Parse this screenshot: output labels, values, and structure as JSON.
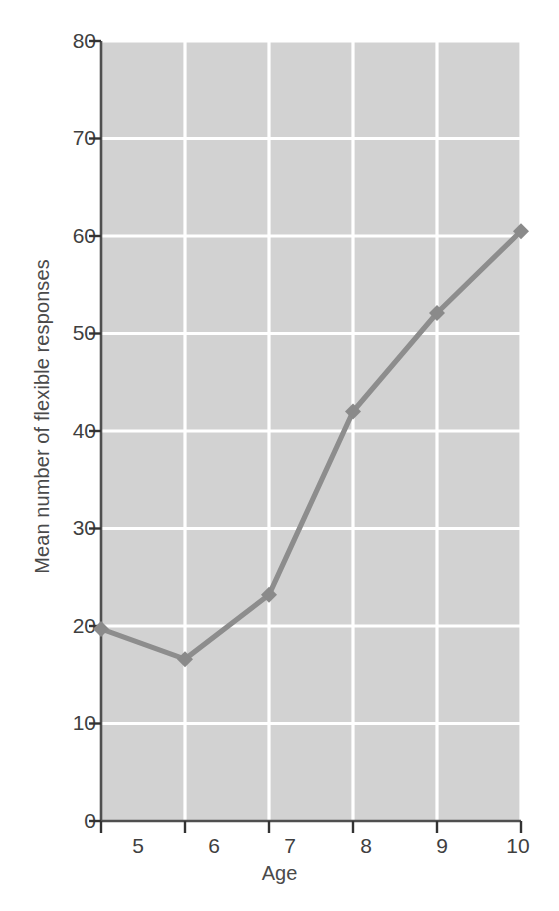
{
  "chart_data": {
    "type": "line",
    "title": "",
    "subtitle": "",
    "xlabel": "Age",
    "ylabel": "Mean number of flexible responses",
    "x": [
      5,
      6,
      7,
      8,
      9,
      10
    ],
    "categories": [
      "5",
      "6",
      "7",
      "8",
      "9",
      "10"
    ],
    "values": [
      19.7,
      16.6,
      23.2,
      42.0,
      52.1,
      60.5
    ],
    "series": [
      {
        "name": "Mean number of flexible responses",
        "values": [
          19.7,
          16.6,
          23.2,
          42.0,
          52.1,
          60.5
        ]
      }
    ],
    "xlim": [
      5,
      10
    ],
    "ylim": [
      0,
      80
    ],
    "xticks": [
      "5",
      "6",
      "7",
      "8",
      "9",
      "10"
    ],
    "yticks": [
      "0",
      "10",
      "20",
      "30",
      "40",
      "50",
      "60",
      "70",
      "80"
    ],
    "ytick_values": [
      0,
      10,
      20,
      30,
      40,
      50,
      60,
      70,
      80
    ],
    "grid": true,
    "grid_color": "#ffffff",
    "legend": false,
    "legend_position": "none",
    "marker": "diamond",
    "plot_background": "#d2d2d2",
    "line_color": "#8d8d8d",
    "marker_color": "#8a8a8a",
    "axis_color": "#4f4f4f",
    "text_color": "#3f3f3f",
    "figure_background": "#ffffff",
    "annotations": []
  }
}
